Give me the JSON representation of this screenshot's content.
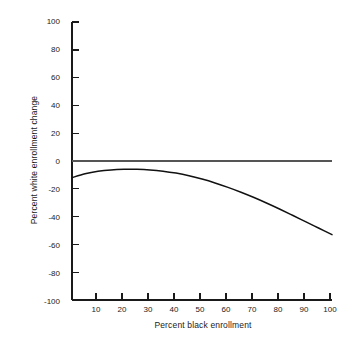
{
  "chart_data": {
    "type": "line",
    "title": "",
    "xlabel": "Percent black enrollment",
    "ylabel": "Percent white enrollment change",
    "xlim": [
      0,
      100
    ],
    "ylim": [
      -100,
      100
    ],
    "xticks": [
      10,
      20,
      30,
      40,
      50,
      60,
      70,
      80,
      90,
      100
    ],
    "yticks": [
      100,
      80,
      60,
      40,
      20,
      0,
      -20,
      -40,
      -60,
      -80,
      -100
    ],
    "xtick_labels": [
      "10",
      "20",
      "30",
      "40",
      "50",
      "60",
      "70",
      "80",
      "90",
      "100"
    ],
    "ytick_labels": [
      "100",
      "80",
      "60",
      "40",
      "20",
      "0",
      "-20",
      "-40",
      "-60",
      "-80",
      "-100"
    ],
    "grid": false,
    "legend": "none",
    "series": [
      {
        "name": "zero reference line",
        "style": "solid",
        "color": "#555555",
        "x": [
          0,
          100
        ],
        "values": [
          0,
          0
        ]
      },
      {
        "name": "white enrollment change curve",
        "style": "solid",
        "color": "#111111",
        "x": [
          0,
          5,
          10,
          15,
          20,
          25,
          30,
          35,
          40,
          45,
          50,
          55,
          60,
          65,
          70,
          75,
          80,
          85,
          90,
          95,
          100
        ],
        "values": [
          -12.0,
          -9.2,
          -7.4,
          -6.4,
          -6.0,
          -6.0,
          -6.4,
          -7.3,
          -8.7,
          -10.6,
          -13.0,
          -15.8,
          -19.0,
          -22.5,
          -26.3,
          -30.4,
          -34.7,
          -39.2,
          -43.8,
          -48.4,
          -53.0
        ]
      }
    ]
  },
  "axes": {
    "y_axis_label": "Percent white enrollment change",
    "x_axis_label": "Percent black enrollment"
  },
  "colors": {
    "background": "#ffffff",
    "axis": "#1a1a1a",
    "curve": "#111111",
    "reference_line": "#555555",
    "text": "#1a1a1a"
  }
}
